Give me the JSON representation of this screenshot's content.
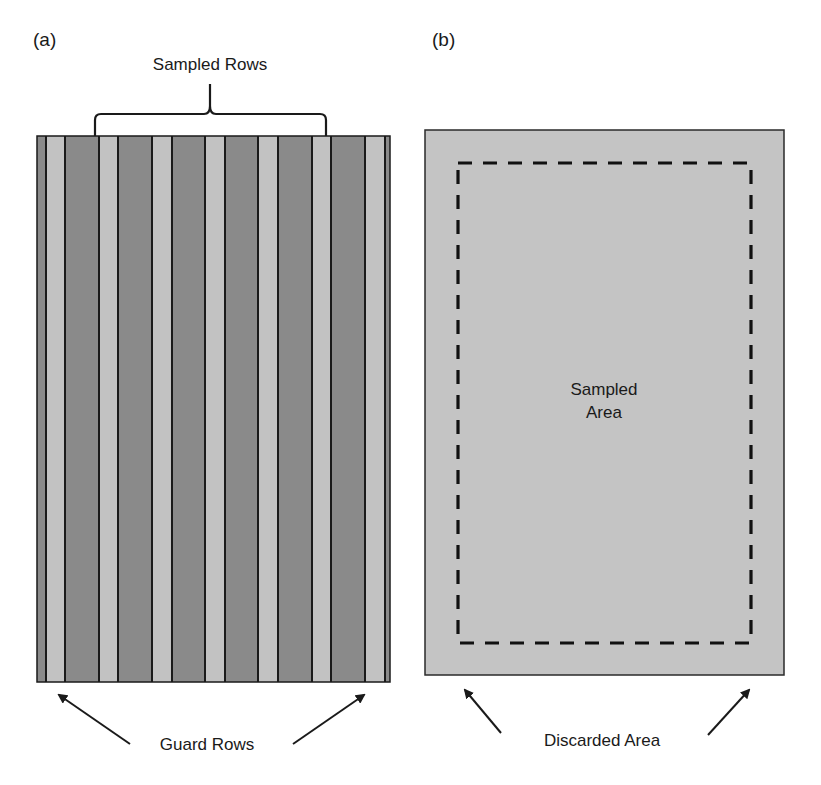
{
  "panel_a": {
    "label": "(a)",
    "bracket_label": "Sampled Rows",
    "bottom_label": "Guard Rows",
    "colors": {
      "dark_stripe": "#8a8a8a",
      "light_stripe": "#c2c2c2",
      "divider": "#1a1a1a"
    },
    "stripes": [
      {
        "x": 37,
        "w": 9,
        "tone": "dark"
      },
      {
        "x": 46,
        "w": 19,
        "tone": "light"
      },
      {
        "x": 65,
        "w": 34,
        "tone": "dark"
      },
      {
        "x": 99,
        "w": 19,
        "tone": "light"
      },
      {
        "x": 118,
        "w": 34,
        "tone": "dark"
      },
      {
        "x": 152,
        "w": 20,
        "tone": "light"
      },
      {
        "x": 172,
        "w": 33,
        "tone": "dark"
      },
      {
        "x": 205,
        "w": 20,
        "tone": "light"
      },
      {
        "x": 225,
        "w": 33,
        "tone": "dark"
      },
      {
        "x": 258,
        "w": 20,
        "tone": "light"
      },
      {
        "x": 278,
        "w": 34,
        "tone": "dark"
      },
      {
        "x": 312,
        "w": 19,
        "tone": "light"
      },
      {
        "x": 331,
        "w": 34,
        "tone": "dark"
      },
      {
        "x": 365,
        "w": 20,
        "tone": "light"
      },
      {
        "x": 385,
        "w": 5,
        "tone": "dark"
      }
    ]
  },
  "panel_b": {
    "label": "(b)",
    "center_label_line1": "Sampled",
    "center_label_line2": "Area",
    "bottom_label": "Discarded Area",
    "colors": {
      "field": "#c4c4c4",
      "border": "#2a2a2a",
      "dash": "#111111"
    }
  }
}
